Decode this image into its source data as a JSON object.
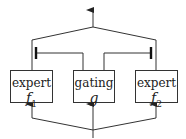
{
  "diagram": {
    "title": "",
    "nodes": [
      {
        "id": "expert1",
        "label": "expert",
        "symbol": "f",
        "subscript": "1"
      },
      {
        "id": "gating",
        "label": "gating",
        "symbol": "g",
        "subscript": ""
      },
      {
        "id": "expert2",
        "label": "expert",
        "symbol": "f",
        "subscript": "2"
      }
    ],
    "edges": [
      {
        "from": "input",
        "to": "expert1",
        "type": "arrow"
      },
      {
        "from": "input",
        "to": "gating",
        "type": "arrow"
      },
      {
        "from": "input",
        "to": "expert2",
        "type": "arrow"
      },
      {
        "from": "gating",
        "to": "expert1-output",
        "type": "gate-bar"
      },
      {
        "from": "gating",
        "to": "expert2-output",
        "type": "gate-bar"
      },
      {
        "from": "expert1",
        "to": "output",
        "type": "line"
      },
      {
        "from": "expert2",
        "to": "output",
        "type": "arrow"
      }
    ],
    "colors": {
      "stroke": "#333333",
      "background": "#ffffff"
    }
  }
}
